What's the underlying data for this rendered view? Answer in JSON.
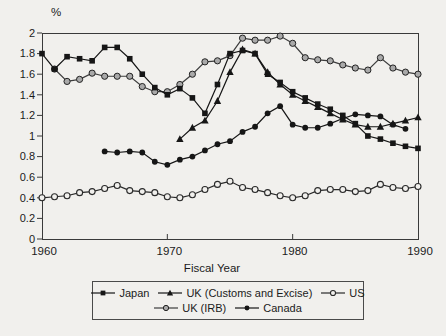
{
  "page": {
    "background_color": "#f1f0ed",
    "ink_color": "#1b1b1b"
  },
  "chart_data": {
    "type": "line",
    "title": "",
    "ylabel": "%",
    "xlabel": "Fiscal Year",
    "xlim": [
      1960,
      1990
    ],
    "ylim": [
      0,
      2
    ],
    "xticks": [
      1960,
      1970,
      1980,
      1990
    ],
    "yticks": [
      0,
      0.2,
      0.4,
      0.6,
      0.8,
      1,
      1.2,
      1.4,
      1.6,
      1.8,
      2
    ],
    "ytick_labels": [
      "0",
      "0.2",
      "0.4",
      "0.6",
      "0.8",
      "1",
      "1.2",
      "1.4",
      "1.6",
      "1.8",
      "2"
    ],
    "grid": false,
    "legend_position": "bottom-box",
    "legend_rows": [
      [
        "Japan",
        "UK (Customs and Excise)",
        "US"
      ],
      [
        "UK (IRB)",
        "Canada"
      ]
    ],
    "series": [
      {
        "name": "Japan",
        "marker": "square-filled",
        "color": "#161616",
        "start_year": 1960,
        "values": [
          1.8,
          1.65,
          1.77,
          1.75,
          1.73,
          1.86,
          1.86,
          1.75,
          1.6,
          1.47,
          1.4,
          1.46,
          1.37,
          1.22,
          1.5,
          1.8,
          1.83,
          1.8,
          1.6,
          1.52,
          1.43,
          1.37,
          1.31,
          1.26,
          1.2,
          1.12,
          1.0,
          0.97,
          0.93,
          0.9,
          0.88
        ]
      },
      {
        "name": "UK (Customs and Excise)",
        "marker": "triangle-filled",
        "color": "#161616",
        "start_year": 1971,
        "values": [
          0.97,
          1.08,
          1.15,
          1.34,
          1.62,
          1.84,
          1.8,
          1.62,
          1.5,
          1.4,
          1.34,
          1.28,
          1.22,
          1.16,
          1.11,
          1.09,
          1.09,
          1.12,
          1.15,
          1.18
        ]
      },
      {
        "name": "US",
        "marker": "circle-open",
        "color": "#2a2a2a",
        "start_year": 1960,
        "values": [
          0.4,
          0.41,
          0.42,
          0.45,
          0.46,
          0.49,
          0.52,
          0.47,
          0.46,
          0.45,
          0.41,
          0.4,
          0.43,
          0.48,
          0.53,
          0.56,
          0.5,
          0.48,
          0.45,
          0.42,
          0.4,
          0.42,
          0.47,
          0.48,
          0.48,
          0.46,
          0.47,
          0.53,
          0.5,
          0.49,
          0.51
        ]
      },
      {
        "name": "UK (IRB)",
        "marker": "circle-gray",
        "color": "#3d3d3d",
        "start_year": 1961,
        "values": [
          1.65,
          1.53,
          1.55,
          1.61,
          1.58,
          1.58,
          1.58,
          1.48,
          1.43,
          1.43,
          1.5,
          1.6,
          1.72,
          1.73,
          1.78,
          1.95,
          1.93,
          1.93,
          1.97,
          1.9,
          1.76,
          1.74,
          1.73,
          1.69,
          1.66,
          1.64,
          1.76,
          1.66,
          1.62,
          1.6
        ]
      },
      {
        "name": "Canada",
        "marker": "circle-filled",
        "color": "#161616",
        "start_year": 1965,
        "values": [
          0.85,
          0.84,
          0.85,
          0.84,
          0.75,
          0.72,
          0.77,
          0.8,
          0.86,
          0.92,
          0.95,
          1.04,
          1.09,
          1.22,
          1.29,
          1.11,
          1.08,
          1.08,
          1.12,
          1.17,
          1.21,
          1.2,
          1.19,
          1.11,
          1.07
        ]
      }
    ]
  }
}
